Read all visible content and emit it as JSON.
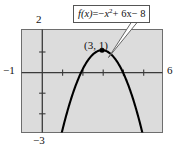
{
  "figure": {
    "kind": "math-graph",
    "background_color": "#ffffff",
    "plot_background_color": "#dcdcdc",
    "frame_color": "#6e6e6e",
    "curve_color": "#000000"
  },
  "equation_callout": {
    "fx": "f(x)",
    "equals": "=",
    "term1_sign": "−",
    "term1_base": "x",
    "term1_exp": "2",
    "term2": "+ 6x",
    "term3": "− 8",
    "full_text": "f(x) = −x² + 6x − 8"
  },
  "vertex": {
    "label": "(3, 1)",
    "x": 3,
    "y": 1
  },
  "axis_labels": {
    "y_top": "2",
    "y_bottom": "−3",
    "x_left": "−1",
    "x_right": "6"
  },
  "chart_data": {
    "type": "line",
    "title": "",
    "subtitle": "",
    "xlabel": "",
    "ylabel": "",
    "function": "f(x) = -x^2 + 6x - 8",
    "equation_label": "f(x) = −x² + 6x − 8",
    "xlim": [
      -1,
      6
    ],
    "ylim": [
      -3,
      2
    ],
    "grid": false,
    "legend": "none",
    "annotations": [
      {
        "text": "(3, 1)",
        "x": 3,
        "y": 1,
        "kind": "vertex-point"
      },
      {
        "text": "f(x) = −x² + 6x − 8",
        "kind": "callout-box",
        "points_to_x": 3.75,
        "points_to_y": 0.45
      }
    ],
    "x_ticks": [
      -1,
      0,
      1,
      2,
      3,
      4,
      5,
      6
    ],
    "x_tick_labels": [
      "−1",
      "",
      "",
      "",
      "",
      "",
      "",
      "6"
    ],
    "y_ticks": [
      -3,
      -2,
      -1,
      0,
      1,
      2
    ],
    "y_tick_labels": [
      "−3",
      "",
      "",
      "",
      "",
      "2"
    ],
    "roots": [
      2,
      4
    ],
    "series": [
      {
        "name": "f(x) = -x^2 + 6x - 8",
        "x": [
          1.55,
          1.7,
          1.9,
          2.1,
          2.3,
          2.5,
          2.7,
          2.9,
          3.0,
          3.1,
          3.3,
          3.5,
          3.7,
          3.9,
          4.1,
          4.3,
          4.45
        ],
        "values": [
          -0.8,
          -0.69,
          0.19,
          0.79,
          1.11,
          1.25,
          1.19,
          0.99,
          1.0,
          0.99,
          1.19,
          1.25,
          1.11,
          0.79,
          0.19,
          -0.69,
          -1.7
        ]
      }
    ]
  }
}
